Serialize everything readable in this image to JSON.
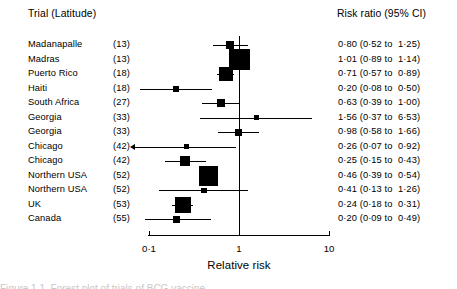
{
  "headers": {
    "trial": "Trial (Latitude)",
    "risk_ratio": "Risk ratio (95% CI)"
  },
  "axis": {
    "label": "Relative risk",
    "ticks": [
      {
        "value": 0.1,
        "label": "0·1"
      },
      {
        "value": 1,
        "label": "1"
      },
      {
        "value": 10,
        "label": "10"
      }
    ],
    "scale": "log",
    "xlim": [
      0.1,
      10
    ],
    "reference_line": 1
  },
  "caption_partial": "Figure 1.1  Forest plot of trials of BCG vaccine",
  "chart_data": {
    "type": "forest",
    "title": "",
    "xlabel": "Relative risk",
    "ylabel": "",
    "xlim": [
      0.1,
      10
    ],
    "xscale": "log",
    "reference_line": 1,
    "grid": false,
    "columns": [
      "Trial",
      "Latitude",
      "Risk ratio (95% CI)"
    ],
    "rows": [
      {
        "trial": "Madanapalle",
        "latitude": "(13)",
        "rr": 0.8,
        "lo": 0.52,
        "hi": 1.25,
        "stat": "0·80 (0·52 to  1·25)",
        "weight": 0.3
      },
      {
        "trial": "Madras",
        "latitude": "(13)",
        "rr": 1.01,
        "lo": 0.89,
        "hi": 1.14,
        "stat": "1·01 (0·89 to  1·14)",
        "weight": 1.0
      },
      {
        "trial": "Puerto Rico",
        "latitude": "(18)",
        "rr": 0.71,
        "lo": 0.57,
        "hi": 0.89,
        "stat": "0·71 (0·57 to  0·89)",
        "weight": 0.62
      },
      {
        "trial": "Haiti",
        "latitude": "(18)",
        "rr": 0.2,
        "lo": 0.08,
        "hi": 0.5,
        "stat": "0·20 (0·08 to  0·50)",
        "weight": 0.16
      },
      {
        "trial": "South Africa",
        "latitude": "(27)",
        "rr": 0.63,
        "lo": 0.39,
        "hi": 1.0,
        "stat": "0·63 (0·39 to  1·00)",
        "weight": 0.26
      },
      {
        "trial": "Georgia",
        "latitude": "(33)",
        "rr": 1.56,
        "lo": 0.37,
        "hi": 6.53,
        "stat": "1·56 (0·37 to  6·53)",
        "weight": 0.09
      },
      {
        "trial": "Georgia",
        "latitude": "(33)",
        "rr": 0.98,
        "lo": 0.58,
        "hi": 1.66,
        "stat": "0·98 (0·58 to  1·66)",
        "weight": 0.2
      },
      {
        "trial": "Chicago",
        "latitude": "(42)",
        "rr": 0.26,
        "lo": 0.07,
        "hi": 0.92,
        "stat": "0·26 (0·07 to  0·92)",
        "weight": 0.12,
        "arrow_left": true
      },
      {
        "trial": "Chicago",
        "latitude": "(42)",
        "rr": 0.25,
        "lo": 0.15,
        "hi": 0.43,
        "stat": "0·25 (0·15 to  0·43)",
        "weight": 0.38
      },
      {
        "trial": "Northern USA",
        "latitude": "(52)",
        "rr": 0.46,
        "lo": 0.39,
        "hi": 0.54,
        "stat": "0·46 (0·39 to  0·54)",
        "weight": 0.92
      },
      {
        "trial": "Northern USA",
        "latitude": "(52)",
        "rr": 0.41,
        "lo": 0.13,
        "hi": 1.26,
        "stat": "0·41 (0·13 to  1·26)",
        "weight": 0.13
      },
      {
        "trial": "UK",
        "latitude": "(53)",
        "rr": 0.24,
        "lo": 0.18,
        "hi": 0.31,
        "stat": "0·24 (0·18 to  0·31)",
        "weight": 0.7
      },
      {
        "trial": "Canada",
        "latitude": "(55)",
        "rr": 0.2,
        "lo": 0.09,
        "hi": 0.49,
        "stat": "0·20 (0·09 to  0·49)",
        "weight": 0.22
      }
    ]
  }
}
